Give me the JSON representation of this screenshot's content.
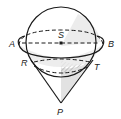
{
  "diagram": {
    "type": "geometry",
    "labels": {
      "A": "A",
      "B": "B",
      "S": "S",
      "R": "R",
      "T": "T",
      "P": "P"
    },
    "colors": {
      "stroke": "#1a1a1a",
      "shade": "#d9d9d9",
      "hatch": "#a8a8a8",
      "background": "#ffffff"
    }
  }
}
